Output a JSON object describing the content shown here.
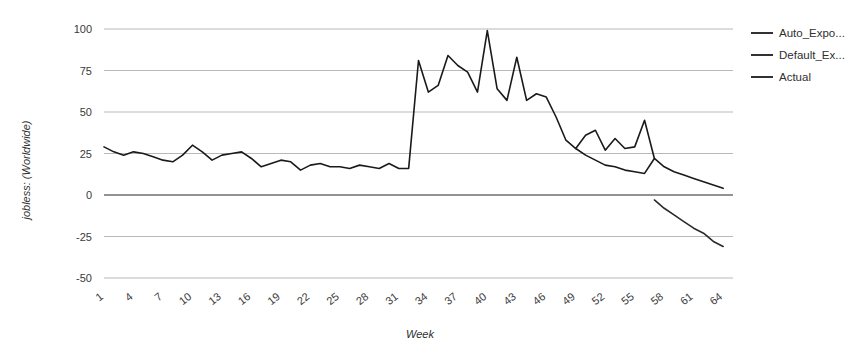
{
  "chart_data": {
    "type": "line",
    "title": "",
    "xlabel": "Week",
    "ylabel": "jobless: (Worldwide)",
    "xlim": [
      1,
      65
    ],
    "ylim": [
      -50,
      100
    ],
    "grid": true,
    "legend_position": "right",
    "y_ticks": [
      "100",
      "75",
      "50",
      "25",
      "0",
      "-25",
      "-50"
    ],
    "y_tick_values": [
      100,
      75,
      50,
      25,
      0,
      -25,
      -50
    ],
    "x_ticks": [
      "1",
      "4",
      "7",
      "10",
      "13",
      "16",
      "19",
      "22",
      "25",
      "28",
      "31",
      "34",
      "37",
      "40",
      "43",
      "46",
      "49",
      "52",
      "55",
      "58",
      "61",
      "64"
    ],
    "x_tick_values": [
      1,
      4,
      7,
      10,
      13,
      16,
      19,
      22,
      25,
      28,
      31,
      34,
      37,
      40,
      43,
      46,
      49,
      52,
      55,
      58,
      61,
      64
    ],
    "series": [
      {
        "name": "Actual",
        "color": "#1a1a1a",
        "x": [
          1,
          2,
          3,
          4,
          5,
          6,
          7,
          8,
          9,
          10,
          11,
          12,
          13,
          14,
          15,
          16,
          17,
          18,
          19,
          20,
          21,
          22,
          23,
          24,
          25,
          26,
          27,
          28,
          29,
          30,
          31,
          32,
          33,
          34,
          35,
          36,
          37,
          38,
          39,
          40,
          41,
          42,
          43,
          44,
          45,
          46,
          47,
          48,
          49,
          50,
          51,
          52,
          53,
          54,
          55,
          56,
          57
        ],
        "values": [
          29,
          26,
          24,
          26,
          25,
          23,
          21,
          20,
          24,
          30,
          26,
          21,
          24,
          25,
          26,
          22,
          17,
          19,
          21,
          20,
          15,
          18,
          19,
          17,
          17,
          16,
          18,
          17,
          16,
          19,
          16,
          16,
          81,
          62,
          66,
          84,
          78,
          74,
          62,
          99,
          64,
          57,
          83,
          57,
          61,
          59,
          47,
          33,
          28,
          36,
          39,
          27,
          34,
          28,
          29,
          45,
          22
        ]
      },
      {
        "name": "Auto_Expo...",
        "color": "#1a1a1a",
        "x": [
          49,
          50,
          51,
          52,
          53,
          54,
          55,
          56,
          57,
          58,
          59,
          60,
          61,
          62,
          63,
          64
        ],
        "values": [
          28,
          24,
          21,
          18,
          17,
          15,
          14,
          13,
          22,
          17,
          14,
          12,
          10,
          8,
          6,
          4
        ]
      },
      {
        "name": "Default_Ex...",
        "color": "#2a2a2a",
        "x": [
          57,
          58,
          59,
          60,
          61,
          62,
          63,
          64
        ],
        "values": [
          -3,
          -8,
          -12,
          -16,
          -20,
          -23,
          -28,
          -31
        ]
      }
    ],
    "legend_entries": [
      "Auto_Expo...",
      "Default_Ex...",
      "Actual"
    ]
  },
  "legend": {
    "items": [
      {
        "label": "Auto_Expo...",
        "color": "#1a1a1a"
      },
      {
        "label": "Default_Ex...",
        "color": "#1a1a1a"
      },
      {
        "label": "Actual",
        "color": "#1a1a1a"
      }
    ]
  },
  "axes": {
    "y_title": "jobless: (Worldwide)",
    "x_title": "Week"
  },
  "colors": {
    "background": "#ffffff",
    "gridline": "#b9b9b9",
    "zero_line": "#6f6f6f",
    "line": "#1a1a1a",
    "text": "#3a3a3a"
  }
}
